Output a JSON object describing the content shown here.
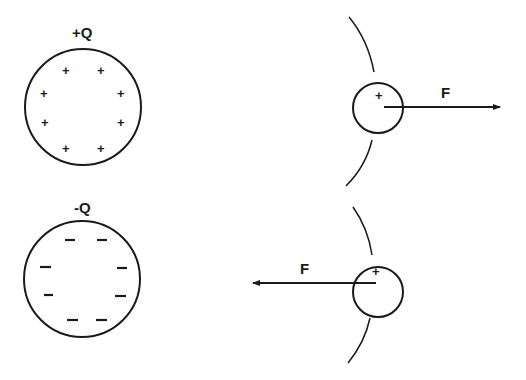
{
  "diagram": {
    "positive_sphere": {
      "label": "+Q",
      "charge_symbol": "+",
      "charge_count": 8
    },
    "negative_sphere": {
      "label": "-Q",
      "charge_symbol": "–",
      "charge_count": 8
    },
    "test_charge_repelled": {
      "charge_symbol": "+",
      "force_label": "F",
      "force_direction": "right"
    },
    "test_charge_attracted": {
      "charge_symbol": "+",
      "force_label": "F",
      "force_direction": "left"
    },
    "colors": {
      "ink": "#1a1a1a",
      "background": "#ffffff"
    }
  }
}
